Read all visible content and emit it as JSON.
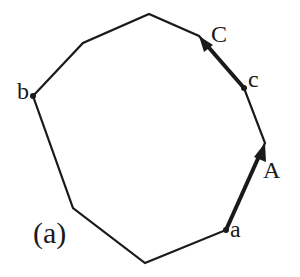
{
  "diagram": {
    "caption": "(a)",
    "polygon": {
      "vertices": [
        {
          "x": 33,
          "y": 96
        },
        {
          "x": 83,
          "y": 43
        },
        {
          "x": 149,
          "y": 14
        },
        {
          "x": 199,
          "y": 36
        },
        {
          "x": 244,
          "y": 88
        },
        {
          "x": 265,
          "y": 143
        },
        {
          "x": 226,
          "y": 230
        },
        {
          "x": 145,
          "y": 263
        },
        {
          "x": 73,
          "y": 208
        }
      ],
      "stroke": "#1a1a1a"
    },
    "labels": {
      "b": "b",
      "C": "C",
      "c": "c",
      "A": "A",
      "a": "a"
    },
    "arrows": [
      {
        "from": "c",
        "to": "C"
      },
      {
        "from": "a",
        "to": "A"
      }
    ]
  }
}
